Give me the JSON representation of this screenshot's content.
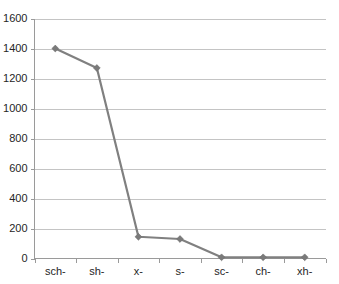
{
  "chart_data": {
    "type": "line",
    "title": "",
    "subtitle": "",
    "xlabel": "",
    "ylabel": "",
    "categories": [
      "sch-",
      "sh-",
      "x-",
      "s-",
      "sc-",
      "ch-",
      "xh-"
    ],
    "values": [
      1400,
      1270,
      145,
      130,
      8,
      8,
      8
    ],
    "series": [
      {
        "name": "Series 1",
        "values": [
          1400,
          1270,
          145,
          130,
          8,
          8,
          8
        ]
      }
    ],
    "ylim": [
      0,
      1600
    ],
    "ytick_labels": [
      "0",
      "200",
      "400",
      "600",
      "800",
      "1000",
      "1200",
      "1400",
      "1600"
    ],
    "ytick_values": [
      0,
      200,
      400,
      600,
      800,
      1000,
      1200,
      1400,
      1600
    ],
    "xtick_labels": [
      "sch-",
      "sh-",
      "x-",
      "s-",
      "sc-",
      "ch-",
      "xh-"
    ],
    "grid": "horizontal",
    "legend": "none",
    "colors": {
      "series_line": "#808080",
      "marker": "#7a7a7a",
      "gridline": "#c4c4c4",
      "axis": "#9a9a9a",
      "text": "#262626",
      "background": "#ffffff"
    }
  }
}
